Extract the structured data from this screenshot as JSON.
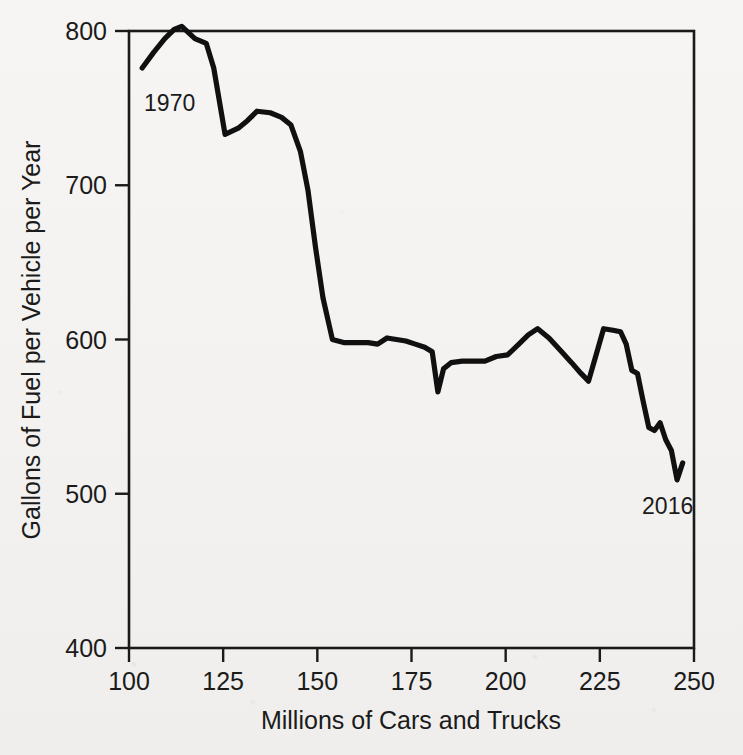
{
  "figure": {
    "background_color": "#f3f2f0",
    "ink_color": "#101010",
    "width": 743,
    "height": 755
  },
  "chart_data": {
    "type": "line",
    "title": "",
    "subtitle": "",
    "xlabel": "Millions of Cars and Trucks",
    "ylabel": "Gallons of Fuel per Vehicle per Year",
    "xlim": [
      100,
      250
    ],
    "ylim": [
      400,
      800
    ],
    "xticks": [
      100,
      125,
      150,
      175,
      200,
      225,
      250
    ],
    "xticklabels": [
      "100",
      "125",
      "150",
      "175",
      "200",
      "225",
      "250"
    ],
    "yticks": [
      400,
      500,
      600,
      700,
      800
    ],
    "yticklabels": [
      "400",
      "500",
      "600",
      "700",
      "800"
    ],
    "grid": false,
    "legend": null,
    "legend_position": "none",
    "frame": "box",
    "annotations": [
      {
        "text": "1970",
        "x": 104,
        "y": 748,
        "anchor": "start",
        "note": "start of series"
      },
      {
        "text": "2016",
        "x": 243,
        "y": 487,
        "anchor": "middle",
        "note": "end of series"
      }
    ],
    "series": [
      {
        "name": "Fuel per vehicle",
        "color": "#101010",
        "x": [
          103.5,
          106.5,
          109.5,
          112.0,
          114.0,
          117.5,
          120.5,
          122.5,
          125.5,
          129.0,
          131.5,
          134.0,
          137.5,
          140.5,
          143.0,
          145.5,
          147.5,
          149.5,
          151.5,
          154.0,
          157.0,
          160.5,
          163.5,
          166.0,
          168.5,
          171.0,
          173.5,
          176.0,
          178.5,
          180.5,
          182.0,
          183.5,
          185.5,
          188.5,
          191.5,
          194.5,
          197.5,
          200.5,
          203.5,
          206.0,
          208.5,
          211.5,
          214.5,
          217.5,
          220.0,
          222.0,
          224.0,
          226.0,
          228.5,
          230.5,
          232.0,
          233.5,
          235.0,
          236.5,
          238.0,
          239.5,
          241.0,
          242.5,
          244.0,
          245.5,
          247.0
        ],
        "y": [
          776,
          786,
          795,
          801,
          803,
          795,
          792,
          776,
          733,
          737,
          742,
          748,
          747,
          744,
          739,
          722,
          697,
          660,
          627,
          600,
          598,
          598,
          598,
          597,
          601,
          600,
          599,
          597,
          595,
          592,
          566,
          581,
          585,
          586,
          586,
          586,
          589,
          590,
          597,
          603,
          607,
          601,
          593,
          585,
          578,
          573,
          590,
          607,
          606,
          605,
          597,
          580,
          578,
          560,
          543,
          541,
          546,
          535,
          528,
          509,
          520
        ]
      }
    ]
  },
  "axis": {
    "x_title": "Millions of Cars and Trucks",
    "y_title": "Gallons of Fuel per Vehicle per Year"
  }
}
